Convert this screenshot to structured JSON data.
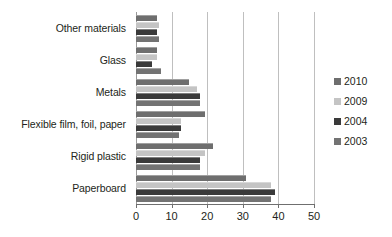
{
  "chart_data": {
    "type": "bar",
    "orientation": "horizontal",
    "title": "",
    "subtitle": "",
    "xlabel": "",
    "ylabel": "",
    "xlim": [
      0,
      50
    ],
    "xticks": [
      0,
      10,
      20,
      30,
      40,
      50
    ],
    "xtick_labels": [
      "0",
      "10",
      "20",
      "30",
      "40",
      "50"
    ],
    "grid": true,
    "grid_axis": "x",
    "legend_position": "right",
    "categories": [
      "Other materials",
      "Glass",
      "Metals",
      "Flexible film, foil, paper",
      "Rigid plastic",
      "Paperboard"
    ],
    "series": [
      {
        "name": "2010",
        "color": "#6e6e6e",
        "values": [
          6.0,
          6.0,
          15.0,
          19.5,
          21.5,
          31.0
        ]
      },
      {
        "name": "2009",
        "color": "#c4c4c4",
        "values": [
          6.5,
          6.0,
          17.0,
          12.5,
          19.5,
          38.0
        ]
      },
      {
        "name": "2004",
        "color": "#3a3a3a",
        "values": [
          6.0,
          4.5,
          18.0,
          12.5,
          18.0,
          39.0
        ]
      },
      {
        "name": "2003",
        "color": "#737373",
        "values": [
          6.5,
          7.0,
          18.0,
          12.0,
          18.0,
          38.0
        ]
      }
    ]
  },
  "legend": {
    "items": [
      {
        "label": "2010",
        "color": "#6e6e6e"
      },
      {
        "label": "2009",
        "color": "#c4c4c4"
      },
      {
        "label": "2004",
        "color": "#3a3a3a"
      },
      {
        "label": "2003",
        "color": "#737373"
      }
    ]
  },
  "colors": {
    "background": "#ffffff",
    "text": "#231f20",
    "gridline": "#bfbfbf",
    "axis": "#6f6f6f"
  }
}
